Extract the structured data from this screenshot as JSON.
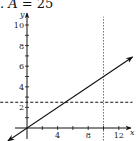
{
  "header": {
    "prefix": ". ",
    "variable": "A",
    "equals": " = 25"
  },
  "chart_data": {
    "type": "line",
    "title": "A = 25",
    "xlabel": "x",
    "ylabel": "y",
    "xlim": [
      -2,
      13.5
    ],
    "ylim": [
      -1,
      11
    ],
    "x_ticks": [
      2,
      4,
      6,
      8,
      10,
      12
    ],
    "x_tick_labels": [
      "4",
      "8",
      "12"
    ],
    "x_tick_label_values": [
      4,
      8,
      12
    ],
    "y_ticks": [
      1,
      2,
      3,
      4,
      5,
      6,
      7,
      8,
      9,
      10
    ],
    "y_tick_labels": [
      "2",
      "4",
      "6",
      "8",
      "10"
    ],
    "y_tick_label_values": [
      2,
      4,
      6,
      8,
      10
    ],
    "grid": false,
    "series": [
      {
        "name": "y = x/2",
        "style": "solid",
        "arrows": "both",
        "x": [
          -2.5,
          13.8
        ],
        "y": [
          -1.25,
          6.9
        ]
      },
      {
        "name": "y = 2.5",
        "style": "dashed",
        "x": [
          -3.5,
          13.8
        ],
        "y": [
          2.5,
          2.5
        ]
      },
      {
        "name": "x = 10",
        "style": "dotted",
        "x": [
          10,
          10
        ],
        "y": [
          -1.2,
          10.8
        ]
      }
    ]
  }
}
